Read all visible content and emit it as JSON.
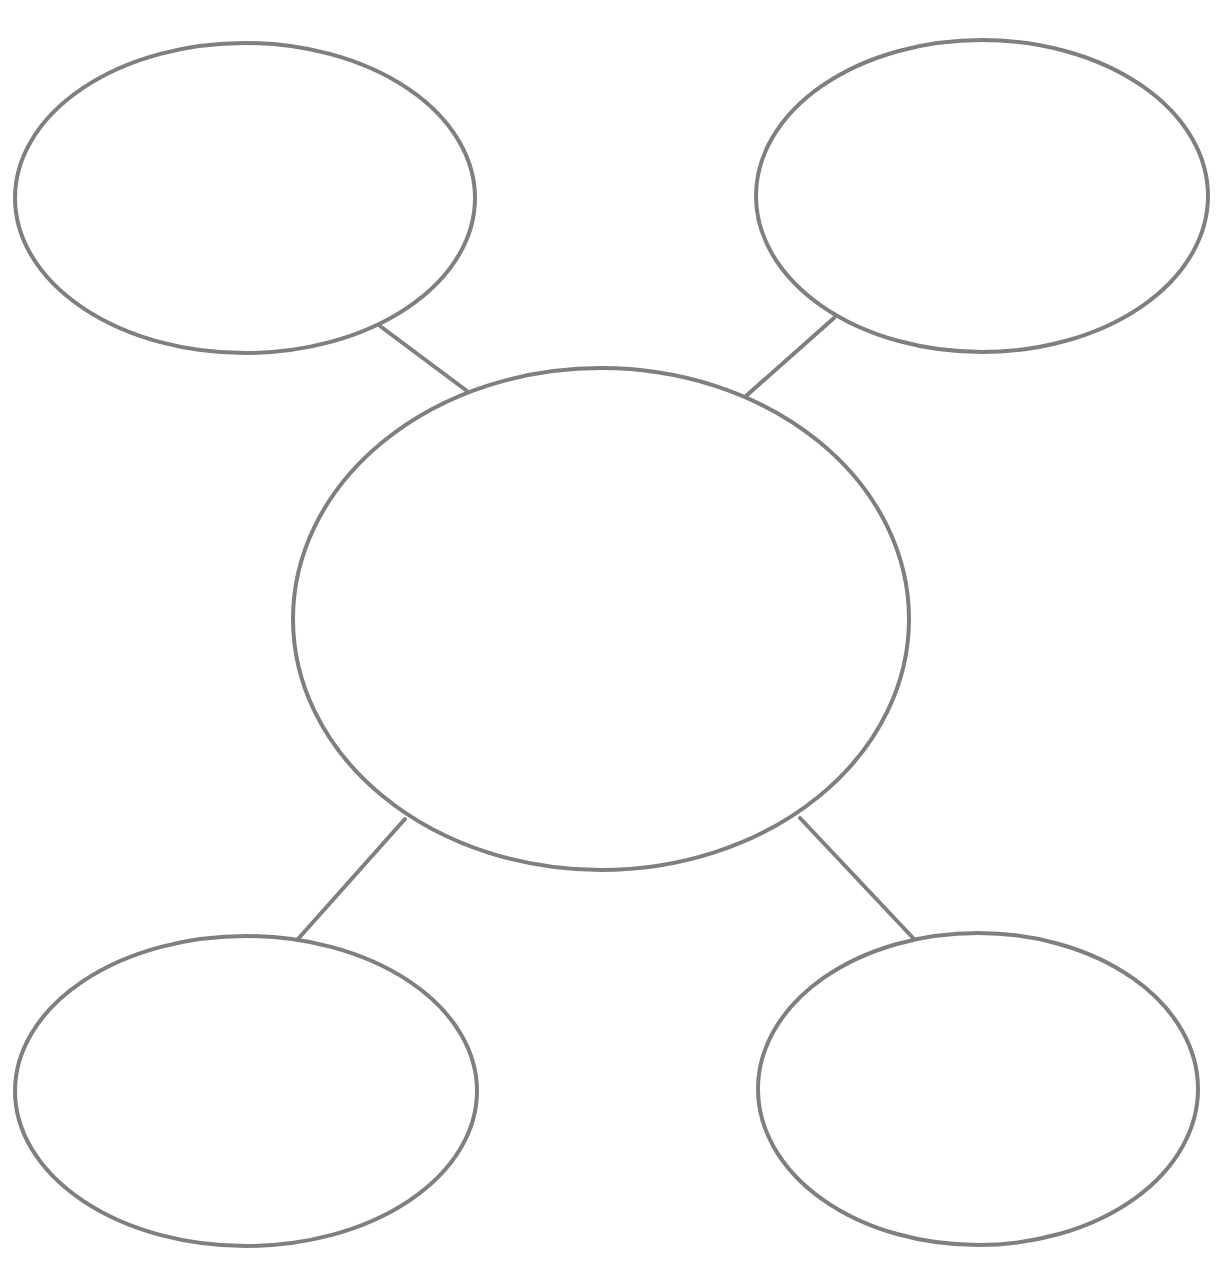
{
  "diagram": {
    "type": "bubble-map",
    "stroke_color": "#7f7f7f",
    "background": "#ffffff",
    "nodes": [
      {
        "id": "center",
        "label": "",
        "cx": 601,
        "cy": 619,
        "rx": 308,
        "ry": 251
      },
      {
        "id": "top-left",
        "label": "",
        "cx": 245,
        "cy": 198,
        "rx": 230,
        "ry": 155
      },
      {
        "id": "top-right",
        "label": "",
        "cx": 982,
        "cy": 196,
        "rx": 226,
        "ry": 156
      },
      {
        "id": "bottom-left",
        "label": "",
        "cx": 246,
        "cy": 1091,
        "rx": 231,
        "ry": 155
      },
      {
        "id": "bottom-right",
        "label": "",
        "cx": 978,
        "cy": 1089,
        "rx": 220,
        "ry": 156
      }
    ],
    "edges": [
      {
        "from": "center",
        "to": "top-left",
        "x1": 467,
        "y1": 391,
        "x2": 380,
        "y2": 326
      },
      {
        "from": "center",
        "to": "top-right",
        "x1": 746,
        "y1": 396,
        "x2": 834,
        "y2": 318
      },
      {
        "from": "center",
        "to": "bottom-left",
        "x1": 405,
        "y1": 819,
        "x2": 298,
        "y2": 939
      },
      {
        "from": "center",
        "to": "bottom-right",
        "x1": 800,
        "y1": 818,
        "x2": 914,
        "y2": 939
      }
    ]
  }
}
